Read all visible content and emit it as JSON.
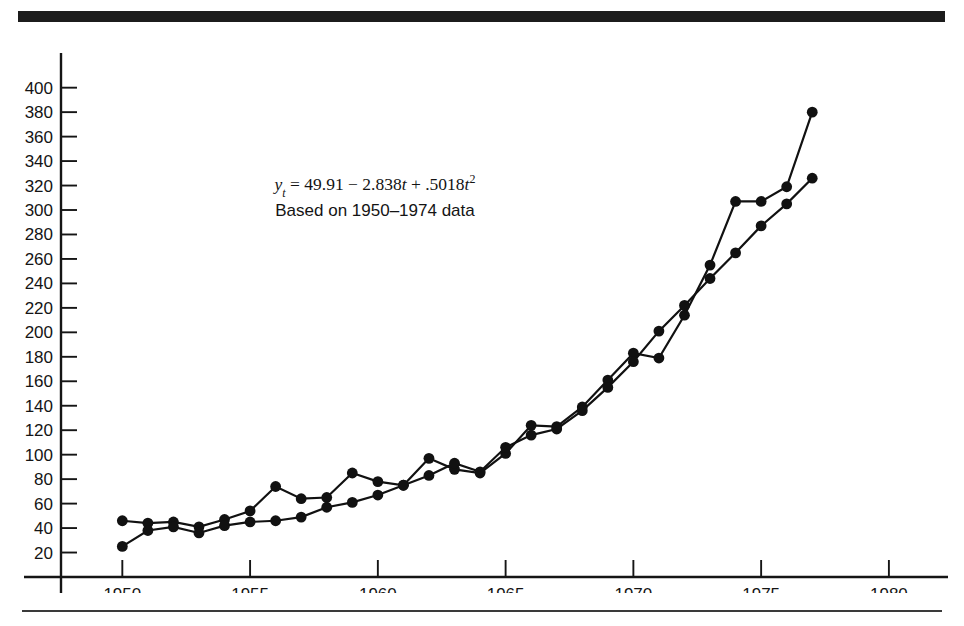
{
  "figure": {
    "annotation_equation_prefix": "y",
    "annotation_equation_sub": "t",
    "annotation_equation_body": " = 49.91 − 2.838",
    "annotation_equation_var1": "t",
    "annotation_equation_mid": " + .5018",
    "annotation_equation_var2": "t",
    "annotation_equation_exp": "2",
    "annotation_equation_full": "y_t = 49.91 − 2.838t + .5018t²",
    "annotation_subtitle": "Based on 1950–1974 data",
    "line_color": "#111111",
    "marker_color": "#111111",
    "axis_color": "#151515",
    "text_color": "#141414",
    "rule_color": "#1c1c1c",
    "background": "#ffffff"
  },
  "chart_data": {
    "type": "line",
    "title": "",
    "xlabel": "",
    "ylabel": "",
    "xlim": [
      1947.6,
      1982.0
    ],
    "ylim": [
      0,
      412
    ],
    "xticks": [
      1950,
      1955,
      1960,
      1965,
      1970,
      1975,
      1980
    ],
    "xtick_labels": [
      "1950",
      "1955",
      "1960",
      "1965",
      "1970",
      "1975",
      "1980"
    ],
    "yticks": [
      20,
      40,
      60,
      80,
      100,
      120,
      140,
      160,
      180,
      200,
      220,
      240,
      260,
      280,
      300,
      320,
      340,
      360,
      380,
      400
    ],
    "ytick_labels": [
      "20",
      "40",
      "60",
      "80",
      "100",
      "120",
      "140",
      "160",
      "180",
      "200",
      "220",
      "240",
      "260",
      "280",
      "300",
      "320",
      "340",
      "360",
      "380",
      "400"
    ],
    "grid": false,
    "legend": false,
    "series": [
      {
        "name": "observed",
        "x": [
          1950,
          1951,
          1952,
          1953,
          1954,
          1955,
          1956,
          1957,
          1958,
          1959,
          1960,
          1961,
          1962,
          1963,
          1964,
          1965,
          1966,
          1967,
          1968,
          1969,
          1970,
          1971,
          1972,
          1973,
          1974,
          1975,
          1976,
          1977
        ],
        "values": [
          46,
          44,
          45,
          41,
          47,
          54,
          74,
          64,
          65,
          85,
          78,
          75,
          97,
          88,
          85,
          101,
          124,
          123,
          139,
          161,
          183,
          179,
          214,
          255,
          307,
          307,
          319,
          380
        ]
      },
      {
        "name": "fitted",
        "x": [
          1950,
          1951,
          1952,
          1953,
          1954,
          1955,
          1956,
          1957,
          1958,
          1959,
          1960,
          1961,
          1962,
          1963,
          1964,
          1965,
          1966,
          1967,
          1968,
          1969,
          1970,
          1971,
          1972,
          1973,
          1974,
          1975,
          1976,
          1977
        ],
        "values": [
          25,
          38,
          41,
          36,
          42,
          45,
          46,
          49,
          57,
          61,
          67,
          75,
          83,
          93,
          86,
          106,
          116,
          121,
          136,
          155,
          176,
          201,
          222,
          244,
          265,
          287,
          305,
          326
        ]
      }
    ]
  }
}
